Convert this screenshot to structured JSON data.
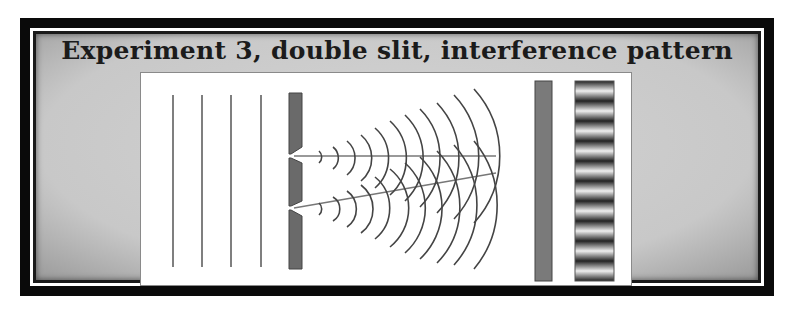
{
  "title": "Experiment 3, double slit, interference pattern",
  "diagram": {
    "incoming_wavefronts": 4,
    "barrier": "double-slit-barrier",
    "slits": 2,
    "detector_screen": "screen-bar",
    "pattern": "interference-pattern",
    "pattern_bright_bands": 10,
    "colors": {
      "frame": "#0a0a0a",
      "background": "#c8c8c8",
      "panel": "#ffffff",
      "barrier": "#6f6f6f",
      "screen": "#7a7a7a",
      "waves": "#4a4a4a"
    }
  }
}
